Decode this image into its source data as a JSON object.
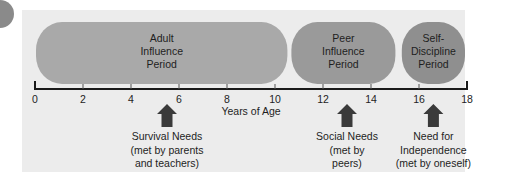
{
  "diagram": {
    "axis": {
      "title": "Years of Age",
      "min": 0,
      "max": 18,
      "ticks": [
        0,
        2,
        4,
        6,
        8,
        10,
        12,
        14,
        16,
        18
      ]
    },
    "periods": [
      {
        "id": "adult",
        "lines": [
          "Adult",
          "Influence",
          "Period"
        ],
        "start": 0,
        "end": 10.6,
        "color": "#a9a9a9"
      },
      {
        "id": "peer",
        "lines": [
          "Peer",
          "Influence",
          "Period"
        ],
        "start": 10.6,
        "end": 15.1,
        "color": "#9a9a9a"
      },
      {
        "id": "self",
        "lines": [
          "Self-",
          "Discipline",
          "Period"
        ],
        "start": 15.2,
        "end": 18,
        "color": "#8f8f8f"
      }
    ],
    "needs": [
      {
        "id": "survival",
        "age": 5.5,
        "lines": [
          "Survival Needs",
          "(met by parents",
          "and teachers)"
        ]
      },
      {
        "id": "social",
        "age": 13,
        "lines": [
          "Social Needs",
          "(met by",
          "peers)"
        ]
      },
      {
        "id": "independence",
        "age": 16.6,
        "lines": [
          "Need for",
          "Independence",
          "(met by oneself)"
        ]
      }
    ],
    "colors": {
      "panel": "#ececec",
      "axis": "#1a1a1a",
      "arrow": "#3a3a3a",
      "text": "#1e1e1e"
    }
  }
}
